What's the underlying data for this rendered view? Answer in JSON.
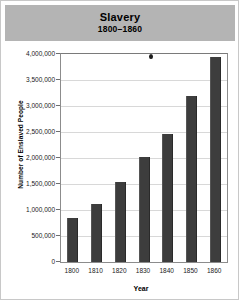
{
  "header": {
    "title": "Slavery",
    "subtitle": "1800–1860",
    "band_color": "#b4b4b4"
  },
  "chart_data": {
    "type": "bar",
    "title": "Slavery",
    "subtitle": "1800–1860",
    "xlabel": "Year",
    "ylabel": "Number of Enslaved People",
    "categories": [
      "1800",
      "1810",
      "1820",
      "1830",
      "1840",
      "1850",
      "1860"
    ],
    "values": [
      850000,
      1120000,
      1540000,
      2010000,
      2470000,
      3200000,
      3950000
    ],
    "ylim": [
      0,
      4000000
    ],
    "ytick_labels": [
      "4,000,000",
      "3,500,000",
      "3,000,000",
      "2,500,000",
      "2,000,000",
      "1,500,000",
      "1,000,000",
      "500,000",
      "0"
    ],
    "ytick_values": [
      4000000,
      3500000,
      3000000,
      2500000,
      2000000,
      1500000,
      1000000,
      500000,
      0
    ],
    "grid": true,
    "legend": "none",
    "bar_color": "#3d3d3d",
    "grid_color": "#d8d8d8",
    "axis_color": "#8c8c8c"
  },
  "artifacts": {
    "speck_label": "ink-speck"
  }
}
